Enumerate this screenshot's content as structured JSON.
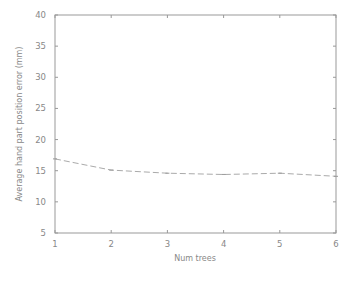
{
  "chart_data": {
    "type": "line",
    "title": "",
    "xlabel": "Num trees",
    "ylabel": "Average hand part position error (mm)",
    "x": [
      1,
      2,
      3,
      4,
      5,
      6
    ],
    "series": [
      {
        "name": "error",
        "values": [
          16.9,
          15.1,
          14.6,
          14.4,
          14.6,
          14.1
        ],
        "color": "#aaaaaa",
        "style": "dashed"
      }
    ],
    "xlim": [
      1,
      6
    ],
    "ylim": [
      5,
      40
    ],
    "xticks": [
      "1",
      "2",
      "3",
      "4",
      "5",
      "6"
    ],
    "yticks": [
      "5",
      "10",
      "15",
      "20",
      "25",
      "30",
      "35",
      "40"
    ],
    "grid": false,
    "legend": null
  }
}
